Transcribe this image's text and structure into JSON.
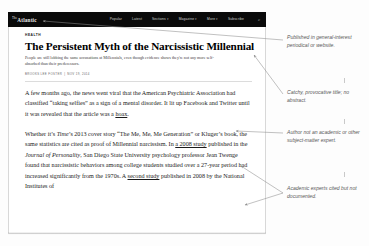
{
  "nav": {
    "brand_prefix": "The",
    "brand": "Atlantic",
    "links": [
      {
        "label": "Popular",
        "caret": false
      },
      {
        "label": "Latest",
        "caret": false
      },
      {
        "label": "Sections",
        "caret": true
      },
      {
        "label": "Magazine",
        "caret": true
      },
      {
        "label": "More",
        "caret": true
      },
      {
        "label": "Subscribe",
        "caret": false
      }
    ],
    "search_icon": "⌕"
  },
  "article": {
    "kicker": "HEALTH",
    "headline": "The Persistent Myth of the Narcissistic Millennial",
    "dek": "People are still lobbing the same accusations at Millennials, even though evidence shows they're not any more self-absorbed than their predecessors.",
    "byline_author": "BROOKS LEE FOSTER",
    "byline_date": "NOV 19, 2014",
    "paragraphs": [
      {
        "runs": [
          {
            "text": "A few months ago, the news went viral that the American Psychiatric Association had classified “taking selfies” as a sign of a mental disorder. It lit up Facebook and Twitter until it was revealed that the article was a ",
            "style": "normal"
          },
          {
            "text": "hoax",
            "style": "link"
          },
          {
            "text": ".",
            "style": "normal"
          }
        ]
      },
      {
        "runs": [
          {
            "text": "Whether it’s ",
            "style": "normal"
          },
          {
            "text": "Time",
            "style": "italic"
          },
          {
            "text": "’s 2013 cover story “The Me, Me, Me Generation” or Kluger’s book, the same statistics are cited as proof of Millennial narcissism. In ",
            "style": "normal"
          },
          {
            "text": "a 2008 study",
            "style": "link"
          },
          {
            "text": " published in the ",
            "style": "normal"
          },
          {
            "text": "Journal of Personality",
            "style": "italic"
          },
          {
            "text": ", San Diego State University psychology professor Jean Twenge found that narcissistic behaviors among college students studied over a 27-year period had increased significantly from the 1970s. A ",
            "style": "normal"
          },
          {
            "text": "second study",
            "style": "link"
          },
          {
            "text": " published in 2008 by the National Institutes of",
            "style": "normal"
          }
        ]
      }
    ]
  },
  "annotations": [
    {
      "text": "Published in general-interest periodical or website."
    },
    {
      "text": "Catchy, provocative title; no abstract."
    },
    {
      "text": "Author not an academic or other subject-matter expert."
    },
    {
      "text": "Academic experts cited but not documented."
    }
  ],
  "colors": {
    "nav_background": "#0a0a0a",
    "page_background": "#fdfdfd",
    "card_background": "#ffffff",
    "annotation_text": "#595959",
    "leader_line": "#9a9a9a"
  }
}
